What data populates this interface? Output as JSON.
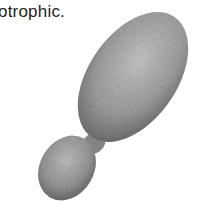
{
  "caption": {
    "text": "otrophic."
  },
  "figure": {
    "colors": {
      "light": "#bdbdbd",
      "mid": "#8f8f8f",
      "dark": "#4a4a4a"
    }
  }
}
